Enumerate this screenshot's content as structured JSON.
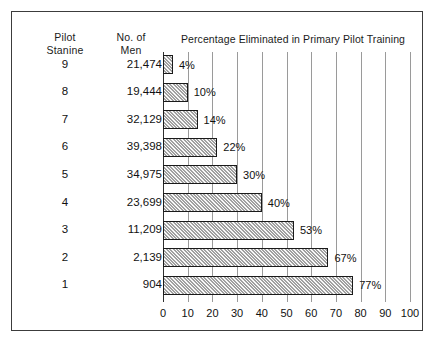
{
  "frame": {
    "border_color": "#3c3c3c"
  },
  "columns": {
    "stanine_header": "Pilot\nStanine",
    "men_header": "No. of\nMen"
  },
  "chart_data": {
    "type": "bar",
    "orientation": "horizontal",
    "title": "Percentage Eliminated in Primary Pilot Training",
    "xlabel": "",
    "ylabel": "Pilot Stanine",
    "xlim": [
      0,
      100
    ],
    "xticks": [
      0,
      10,
      20,
      30,
      40,
      50,
      60,
      70,
      80,
      90,
      100
    ],
    "grid": true,
    "legend": null,
    "categories": [
      "9",
      "8",
      "7",
      "6",
      "5",
      "4",
      "3",
      "2",
      "1"
    ],
    "values": [
      4,
      10,
      14,
      22,
      30,
      40,
      53,
      67,
      77
    ],
    "data_labels": [
      "4%",
      "10%",
      "14%",
      "22%",
      "30%",
      "40%",
      "53%",
      "67%",
      "77%"
    ],
    "secondary_series": {
      "name": "No. of Men",
      "values": [
        21474,
        19444,
        32129,
        39398,
        34975,
        23699,
        11209,
        2139,
        904
      ],
      "labels": [
        "21,474",
        "19,444",
        "32,129",
        "39,398",
        "34,975",
        "23,699",
        "11,209",
        "2,139",
        "904"
      ]
    },
    "bar_fill": "#d2d2d2",
    "bar_border": "#1a1a1a",
    "gridline_color": "#9a9a9a"
  }
}
